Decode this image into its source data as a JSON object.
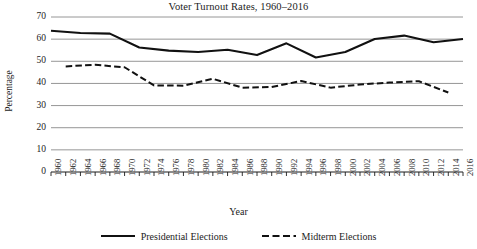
{
  "chart_data": {
    "type": "line",
    "title": "Voter Turnout Rates, 1960–2016",
    "xlabel": "Year",
    "ylabel": "Percentage",
    "ylim": [
      0,
      70
    ],
    "xlim": [
      1960,
      2016
    ],
    "ytick_labels": [
      "0",
      "10",
      "20",
      "30",
      "40",
      "50",
      "60",
      "70"
    ],
    "ytick_values": [
      0,
      10,
      20,
      30,
      40,
      50,
      60,
      70
    ],
    "grid": true,
    "grid_axis": "y",
    "legend_position": "bottom",
    "x": [
      1960,
      1962,
      1964,
      1966,
      1968,
      1970,
      1972,
      1974,
      1976,
      1978,
      1980,
      1982,
      1984,
      1986,
      1988,
      1990,
      1992,
      1994,
      1996,
      1998,
      2000,
      2002,
      2004,
      2006,
      2008,
      2010,
      2012,
      2014,
      2016
    ],
    "xtick_labels": [
      "1960",
      "1962",
      "1964",
      "1966",
      "1968",
      "1970",
      "1972",
      "1974",
      "1976",
      "1978",
      "1980",
      "1982",
      "1984",
      "1986",
      "1988",
      "1990",
      "1992",
      "1994",
      "1996",
      "1998",
      "2000",
      "2002",
      "2004",
      "2006",
      "2008",
      "2010",
      "2012",
      "2014",
      "2016"
    ],
    "series": [
      {
        "name": "Presidential Elections",
        "style": "solid",
        "color": "#111111",
        "x": [
          1960,
          1964,
          1968,
          1972,
          1976,
          1980,
          1984,
          1988,
          1992,
          1996,
          2000,
          2004,
          2008,
          2012,
          2016
        ],
        "values": [
          63.8,
          62.8,
          62.5,
          56.2,
          54.8,
          54.2,
          55.2,
          52.8,
          58.1,
          51.7,
          54.2,
          60.1,
          61.6,
          58.6,
          60.1
        ]
      },
      {
        "name": "Midterm Elections",
        "style": "dashed",
        "color": "#111111",
        "x": [
          1962,
          1966,
          1970,
          1974,
          1978,
          1982,
          1986,
          1990,
          1994,
          1998,
          2002,
          2006,
          2010,
          2014
        ],
        "values": [
          47.7,
          48.4,
          47.3,
          39.1,
          39.0,
          42.1,
          38.1,
          38.4,
          41.1,
          38.1,
          39.5,
          40.4,
          41.0,
          35.9
        ]
      }
    ]
  },
  "legend": {
    "entries": [
      {
        "label": "Presidential Elections",
        "style": "solid"
      },
      {
        "label": "Midterm Elections",
        "style": "dashed"
      }
    ]
  }
}
